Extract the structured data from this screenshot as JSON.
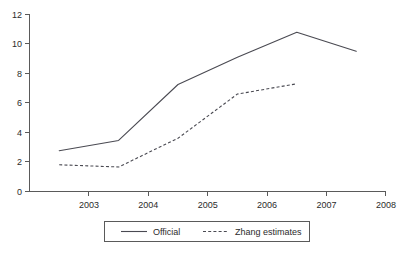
{
  "chart_data": {
    "type": "line",
    "title": "",
    "subtitle": "",
    "xlabel": "",
    "ylabel": "",
    "xlim": [
      2002,
      2008
    ],
    "ylim": [
      0,
      12
    ],
    "grid": false,
    "legend_position": "bottom-center",
    "y_ticks": [
      0,
      2,
      4,
      6,
      8,
      10,
      12
    ],
    "y_tick_labels": [
      "0",
      "2",
      "4",
      "6",
      "8",
      "10",
      "12"
    ],
    "x_ticks": [
      2003,
      2004,
      2005,
      2006,
      2007,
      2008
    ],
    "x_tick_labels": [
      "2003",
      "2004",
      "2005",
      "2006",
      "2007",
      "2008"
    ],
    "x": [
      2002.5,
      2003.5,
      2004.5,
      2005.5,
      2006.5,
      2007.5
    ],
    "series": [
      {
        "name": "Official",
        "style": "solid",
        "color": "#4a4a52",
        "values": [
          2.75,
          3.45,
          7.25,
          9.1,
          10.8,
          9.5
        ]
      },
      {
        "name": "Zhang estimates",
        "style": "dashed",
        "color": "#4a4a52",
        "values": [
          1.8,
          1.65,
          3.6,
          6.6,
          7.3,
          null
        ]
      }
    ],
    "legend": [
      {
        "label": "Official",
        "style": "solid"
      },
      {
        "label": "Zhang estimates",
        "style": "dashed"
      }
    ]
  },
  "axes": {
    "y_labels": [
      "12",
      "10",
      "8",
      "6",
      "4",
      "2",
      "0"
    ],
    "x_labels": [
      "2003",
      "2004",
      "2005",
      "2006",
      "2007",
      "2008"
    ]
  },
  "legend": {
    "official_label": "Official",
    "zhang_label": "Zhang estimates"
  },
  "colors": {
    "line": "#4a4a52",
    "axis": "#5a5a5a",
    "text": "#2b2b2b",
    "background": "#ffffff"
  }
}
